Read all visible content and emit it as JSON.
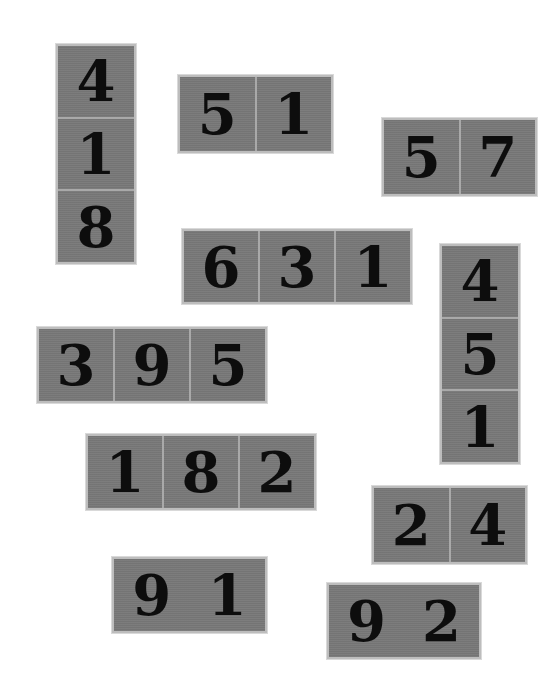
{
  "puzzle": {
    "tile_color": "#787878",
    "digit_color": "#0d0d0d",
    "tiles": [
      {
        "id": "t1",
        "orientation": "vertical",
        "digits": [
          "4",
          "1",
          "8"
        ]
      },
      {
        "id": "t2",
        "orientation": "horizontal",
        "digits": [
          "5",
          "1"
        ]
      },
      {
        "id": "t3",
        "orientation": "horizontal",
        "digits": [
          "5",
          "7"
        ]
      },
      {
        "id": "t4",
        "orientation": "horizontal",
        "digits": [
          "6",
          "3",
          "1"
        ]
      },
      {
        "id": "t5",
        "orientation": "vertical",
        "digits": [
          "4",
          "5",
          "1"
        ]
      },
      {
        "id": "t6",
        "orientation": "horizontal",
        "digits": [
          "3",
          "9",
          "5"
        ]
      },
      {
        "id": "t7",
        "orientation": "horizontal",
        "digits": [
          "1",
          "8",
          "2"
        ]
      },
      {
        "id": "t8",
        "orientation": "horizontal",
        "digits": [
          "2",
          "4"
        ]
      },
      {
        "id": "t9",
        "orientation": "horizontal",
        "digits": [
          "9",
          "1"
        ]
      },
      {
        "id": "t10",
        "orientation": "horizontal",
        "digits": [
          "9",
          "2"
        ]
      }
    ]
  }
}
